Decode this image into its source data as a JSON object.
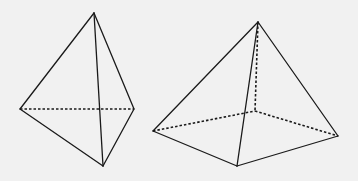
{
  "diagram": {
    "background": "#f1f1f1",
    "stroke_color": "#1a1a1a",
    "shapes": [
      {
        "name": "tetrahedron",
        "vertices": {
          "apex": [
            94,
            13
          ],
          "left": [
            20,
            109
          ],
          "right": [
            134,
            109
          ],
          "bottom": [
            103,
            166
          ]
        },
        "visible_edges": [
          [
            "apex",
            "left"
          ],
          [
            "apex",
            "right"
          ],
          [
            "apex",
            "bottom"
          ],
          [
            "left",
            "bottom"
          ],
          [
            "right",
            "bottom"
          ]
        ],
        "hidden_edges": [
          [
            "left",
            "right"
          ]
        ]
      },
      {
        "name": "square-pyramid",
        "vertices": {
          "apex": [
            258,
            22
          ],
          "left": [
            153,
            131
          ],
          "right": [
            338,
            136
          ],
          "front": [
            237,
            166
          ],
          "back": [
            255,
            111
          ]
        },
        "visible_edges": [
          [
            "apex",
            "left"
          ],
          [
            "apex",
            "right"
          ],
          [
            "apex",
            "front"
          ],
          [
            "left",
            "front"
          ],
          [
            "front",
            "right"
          ]
        ],
        "hidden_edges": [
          [
            "apex",
            "back"
          ],
          [
            "left",
            "back"
          ],
          [
            "back",
            "right"
          ]
        ]
      }
    ]
  }
}
